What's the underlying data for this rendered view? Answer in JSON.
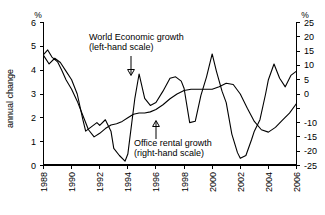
{
  "chart_data": {
    "type": "line",
    "title": "",
    "xlabel": "",
    "ylabel": "annual change",
    "left_axis": {
      "unit_label": "%",
      "ticks": [
        "0",
        "1",
        "2",
        "3",
        "4",
        "5",
        "6"
      ],
      "ylim": [
        0,
        6
      ]
    },
    "right_axis": {
      "unit_label": "%",
      "ticks": [
        "-25",
        "-20",
        "-15",
        "-10",
        "0",
        "5",
        "10",
        "15",
        "20",
        "25"
      ],
      "ylim": [
        -25,
        25
      ]
    },
    "x_ticks": [
      "1988",
      "1990",
      "1992",
      "1994",
      "1996",
      "1998",
      "2000",
      "2002",
      "2004",
      "2006"
    ],
    "xlim": [
      1988,
      2006
    ],
    "grid": false,
    "legend_position": "inline-annotations",
    "annotations": [
      {
        "name": "world-economic-growth",
        "line1": "World Economic growth",
        "line2": "(left-hand scale)",
        "arrow": "down"
      },
      {
        "name": "office-rental-growth",
        "line1": "Office rental growth",
        "line2": "(right-hand scale)",
        "arrow": "up"
      }
    ],
    "series": [
      {
        "name": "World Economic growth",
        "axis": "left",
        "unit": "%",
        "x": [
          1988.0,
          1988.3,
          1988.6,
          1989.0,
          1989.3,
          1989.6,
          1990.0,
          1990.4,
          1990.8,
          1991.2,
          1991.6,
          1992.0,
          1992.4,
          1992.8,
          1993.2,
          1993.6,
          1994.0,
          1994.4,
          1994.8,
          1995.2,
          1995.6,
          1996.0,
          1996.5,
          1997.0,
          1997.5,
          1998.0,
          1998.5,
          1999.0,
          1999.5,
          2000.0,
          2000.5,
          2001.0,
          2001.5,
          2002.0,
          2002.5,
          2003.0,
          2003.5,
          2004.0,
          2004.5,
          2005.0,
          2005.5,
          2006.0
        ],
        "y": [
          4.65,
          4.85,
          4.55,
          4.35,
          4.0,
          3.6,
          3.2,
          2.7,
          2.1,
          1.5,
          1.2,
          1.35,
          1.55,
          1.7,
          1.75,
          1.85,
          2.0,
          2.15,
          2.2,
          2.2,
          2.25,
          2.35,
          2.55,
          2.8,
          3.0,
          3.15,
          3.2,
          3.2,
          3.2,
          3.2,
          3.3,
          3.45,
          3.4,
          3.0,
          2.4,
          1.85,
          1.5,
          1.4,
          1.6,
          1.9,
          2.2,
          2.6
        ]
      },
      {
        "name": "Office rental growth",
        "axis": "right",
        "unit": "%",
        "x": [
          1988.0,
          1988.4,
          1988.8,
          1989.2,
          1989.6,
          1990.0,
          1990.4,
          1990.8,
          1991.0,
          1991.4,
          1991.8,
          1992.0,
          1992.4,
          1992.8,
          1993.0,
          1993.4,
          1993.8,
          1994.0,
          1994.5,
          1994.8,
          1995.2,
          1995.6,
          1996.0,
          1996.5,
          1997.0,
          1997.4,
          1997.8,
          1998.0,
          1998.4,
          1998.8,
          1999.2,
          1999.6,
          2000.0,
          2000.3,
          2000.7,
          2001.0,
          2001.4,
          2001.8,
          2002.0,
          2002.4,
          2002.8,
          2003.0,
          2003.4,
          2003.8,
          2004.0,
          2004.4,
          2004.8,
          2005.2,
          2005.6,
          2006.0
        ],
        "y": [
          13.5,
          10.5,
          12.5,
          11.0,
          8.0,
          5.0,
          0.0,
          -9.0,
          -13.0,
          -11.5,
          -10.0,
          -11.0,
          -9.0,
          -13.0,
          -19.0,
          -21.5,
          -23.5,
          -21.0,
          -1.5,
          7.0,
          -1.5,
          -4.0,
          -3.0,
          1.0,
          5.5,
          6.0,
          4.5,
          2.0,
          -10.0,
          -9.5,
          -0.5,
          6.0,
          14.0,
          8.0,
          1.0,
          -3.0,
          -14.0,
          -20.5,
          -22.5,
          -21.5,
          -16.0,
          -13.0,
          -9.0,
          0.0,
          5.0,
          10.5,
          5.5,
          2.5,
          6.5,
          8.0
        ]
      }
    ]
  }
}
